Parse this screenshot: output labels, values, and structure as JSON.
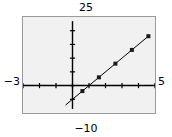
{
  "chart_data": {
    "type": "line",
    "title": "",
    "xlabel": "",
    "ylabel": "",
    "xlim": [
      -3,
      5
    ],
    "ylim": [
      -10,
      25
    ],
    "xtick_labels": {
      "min": "−3",
      "max": "5"
    },
    "ytick_labels": {
      "min": "−10",
      "max": "25"
    },
    "xticks": [
      -3,
      -2,
      -1,
      0,
      1,
      2,
      3,
      4,
      5
    ],
    "yticks": [
      -10,
      -5,
      0,
      5,
      10,
      15,
      20,
      25
    ],
    "grid": false,
    "legend": null,
    "axes_style": "centered-cross",
    "line": {
      "color": "#000000",
      "width": 1,
      "x": [
        -0.4,
        4.6
      ],
      "y": [
        -7.0,
        18.0
      ]
    },
    "series": [
      {
        "name": "data",
        "marker": "square",
        "marker_color": "#1a1a1a",
        "x": [
          0.6,
          1.6,
          2.6,
          3.6,
          4.6
        ],
        "y": [
          -2.0,
          3.0,
          8.0,
          13.0,
          18.0
        ]
      }
    ]
  },
  "labels": {
    "top": "25",
    "bottom": "−10",
    "left": "−3",
    "right": "5"
  },
  "colors": {
    "plot_background": "#f1f1f1",
    "frame": "#9a9a9a",
    "axis": "#000000",
    "data": "#1a1a1a",
    "page_background": "#ffffff"
  }
}
